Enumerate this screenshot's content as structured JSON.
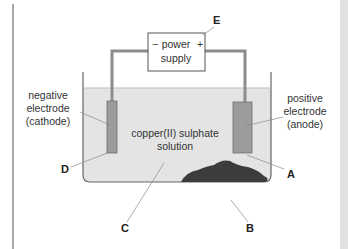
{
  "diagram": {
    "power_supply": {
      "line1": "power",
      "line2": "supply",
      "negative_sign": "−",
      "positive_sign": "+"
    },
    "solution_label": {
      "line1": "copper(II) sulphate",
      "line2": "solution"
    },
    "negative_electrode": {
      "line1": "negative",
      "line2": "electrode",
      "line3": "(cathode)"
    },
    "positive_electrode": {
      "line1": "positive",
      "line2": "electrode",
      "line3": "(anode)"
    },
    "letters": {
      "A": "A",
      "B": "B",
      "C": "C",
      "D": "D",
      "E": "E"
    },
    "colors": {
      "solution": "#e4e4e4",
      "electrode": "#9c9c9c",
      "wire": "#8c8c8c",
      "sludge": "#3c3c3c",
      "outline": "#555555"
    }
  }
}
